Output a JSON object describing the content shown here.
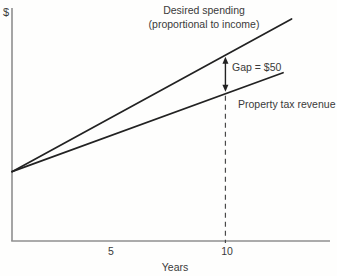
{
  "figure": {
    "y_axis_label": "$",
    "x_axis_label": "Years",
    "upper_series_label_line1": "Desired spending",
    "upper_series_label_line2": "(proportional to income)",
    "gap_label": "Gap = $50",
    "lower_series_label": "Property tax revenue"
  },
  "chart_data": {
    "type": "line",
    "title": "",
    "xlabel": "Years",
    "ylabel": "$",
    "xlim": [
      0,
      14.9
    ],
    "ylim": [
      11,
      310
    ],
    "x_ticks": [
      5,
      10
    ],
    "grid": false,
    "legend_position": "inline-annotations",
    "line_color": "#222222",
    "axis_color": "#8f8f8f",
    "dash_color": "#4a4a4a",
    "series": [
      {
        "name": "Desired spending (proportional to income)",
        "x": [
          0,
          13.1
        ],
        "y": [
          100,
          296
        ]
      },
      {
        "name": "Property tax revenue",
        "x": [
          0,
          12.7
        ],
        "y": [
          100,
          227
        ]
      }
    ],
    "annotations": [
      {
        "type": "gap_arrow",
        "x": 10,
        "y_top": 250,
        "y_bottom": 200,
        "label": "Gap = $50"
      },
      {
        "type": "dashed_vline",
        "x": 10,
        "y_from": 200,
        "y_to": 11
      }
    ]
  }
}
